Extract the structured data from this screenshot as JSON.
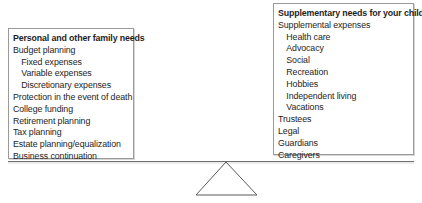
{
  "left_panel": {
    "title": "Personal and other family needs",
    "items": [
      {
        "label": "Budget planning",
        "level": 0
      },
      {
        "label": "Fixed expenses",
        "level": 1
      },
      {
        "label": "Variable expenses",
        "level": 1
      },
      {
        "label": "Discretionary expenses",
        "level": 1
      },
      {
        "label": "Protection in the event of death",
        "level": 0
      },
      {
        "label": "College funding",
        "level": 0
      },
      {
        "label": "Retirement planning",
        "level": 0
      },
      {
        "label": "Tax planning",
        "level": 0
      },
      {
        "label": "Estate planning/equalization",
        "level": 0
      },
      {
        "label": "Business continuation",
        "level": 0
      }
    ]
  },
  "right_panel": {
    "title": "Supplementary needs for your child",
    "items": [
      {
        "label": "Supplemental expenses",
        "level": 0
      },
      {
        "label": "Health care",
        "level": 1
      },
      {
        "label": "Advocacy",
        "level": 1
      },
      {
        "label": "Social",
        "level": 1
      },
      {
        "label": "Recreation",
        "level": 1
      },
      {
        "label": "Hobbies",
        "level": 1
      },
      {
        "label": "Independent living",
        "level": 1
      },
      {
        "label": "Vacations",
        "level": 1
      },
      {
        "label": "Trustees",
        "level": 0
      },
      {
        "label": "Legal",
        "level": 0
      },
      {
        "label": "Guardians",
        "level": 0
      },
      {
        "label": "Caregivers",
        "level": 0
      }
    ]
  },
  "colors": {
    "text": "#1e1e1e",
    "border": "#9a9a9a",
    "beam": "#6e6e6e"
  }
}
